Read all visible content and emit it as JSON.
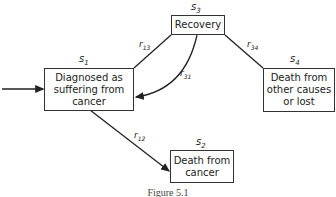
{
  "states": {
    "s1": {
      "symbol": "s",
      "index": "1",
      "label": "Diagnosed as\nsuffering from\ncancer"
    },
    "s2": {
      "symbol": "s",
      "index": "2",
      "label": "Death from\ncancer"
    },
    "s3": {
      "symbol": "s",
      "index": "3",
      "label": "Recovery"
    },
    "s4": {
      "symbol": "s",
      "index": "4",
      "label": "Death from\nother causes\nor lost"
    }
  },
  "rates": {
    "r13": {
      "symbol": "r",
      "index": "13"
    },
    "r31": {
      "symbol": "r",
      "index": "31"
    },
    "r34": {
      "symbol": "r",
      "index": "34"
    },
    "r12": {
      "symbol": "r",
      "index": "12"
    }
  },
  "caption": "Figure 5.1"
}
